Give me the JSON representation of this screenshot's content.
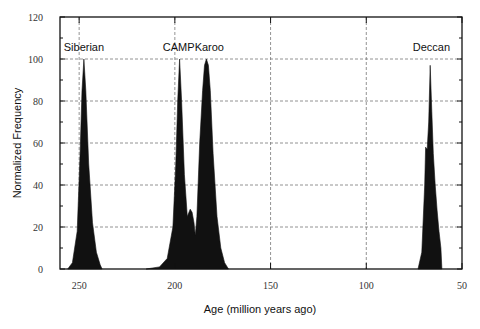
{
  "chart_data": {
    "type": "area",
    "title": "",
    "xlabel": "Age (million years ago)",
    "ylabel": "Normalized Frequency",
    "xlim": [
      260,
      50
    ],
    "ylim": [
      0,
      120
    ],
    "x_reversed": true,
    "x_ticks": [
      250,
      200,
      150,
      100,
      50
    ],
    "y_ticks": [
      0,
      20,
      40,
      60,
      80,
      100,
      120
    ],
    "grid": "dashed",
    "legend": "none",
    "fill_color": "#111111",
    "annotations": [
      {
        "text": "Siberian",
        "x": 247.5
      },
      {
        "text": "CAMP",
        "x": 198
      },
      {
        "text": "Karoo",
        "x": 182
      },
      {
        "text": "Deccan",
        "x": 66
      }
    ],
    "series": [
      {
        "name": "Siberian",
        "x": [
          256,
          253.5,
          251,
          249.5,
          248.5,
          247.5,
          246.5,
          245,
          243,
          241,
          239,
          238
        ],
        "values": [
          0,
          3,
          18,
          55,
          85,
          100,
          85,
          50,
          22,
          8,
          2,
          0
        ]
      },
      {
        "name": "CAMP-Karoo",
        "x": [
          215,
          208,
          204,
          201,
          199.5,
          198.5,
          197.5,
          196.5,
          195,
          193.5,
          192,
          191,
          190,
          189.3,
          188.5,
          187,
          185.5,
          184.5,
          183.5,
          182.5,
          181.5,
          180,
          178,
          176,
          174,
          172
        ],
        "values": [
          0,
          1,
          5,
          20,
          50,
          80,
          100,
          80,
          45,
          25,
          28.5,
          27,
          22,
          16,
          25,
          60,
          85,
          97,
          100,
          97,
          85,
          55,
          25,
          10,
          3,
          0
        ]
      },
      {
        "name": "Deccan",
        "x": [
          73,
          71,
          69.5,
          69,
          68.2,
          67.4,
          66.6,
          65.8,
          65,
          64,
          63,
          62.2,
          62,
          61,
          60.5
        ],
        "values": [
          0,
          8,
          40,
          58,
          57,
          70,
          97,
          75,
          55,
          40,
          28,
          20,
          18,
          10,
          0
        ]
      }
    ]
  }
}
